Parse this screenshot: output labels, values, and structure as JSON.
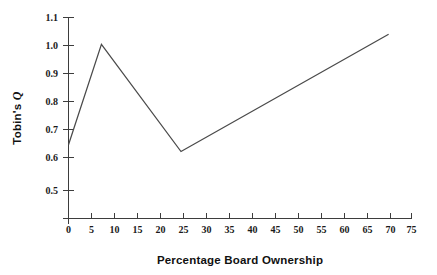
{
  "chart_data": {
    "type": "line",
    "title": "",
    "xlabel": "Percentage Board Ownership",
    "ylabel": "Tobin's Q",
    "ylabel_parts": {
      "prefix": "Tobin's ",
      "symbol": "Q"
    },
    "xlim": [
      0,
      75
    ],
    "ylim": [
      0.5,
      1.1
    ],
    "xticks": [
      0,
      5,
      10,
      15,
      20,
      25,
      30,
      35,
      40,
      45,
      50,
      55,
      60,
      65,
      70,
      75
    ],
    "xtick_labels": [
      "0",
      "5",
      "10",
      "15",
      "20",
      "25",
      "30",
      "35",
      "40",
      "45",
      "50",
      "55",
      "60",
      "65",
      "70",
      "75"
    ],
    "yticks": [
      0.5,
      0.6,
      0.7,
      0.8,
      0.9,
      1.0,
      1.1
    ],
    "ytick_labels": [
      "0.5",
      "0.6",
      "0.7",
      "0.8",
      "0.9",
      "1.0",
      "1.1"
    ],
    "grid": false,
    "legend": null,
    "series": [
      {
        "name": "Tobin's Q vs Percentage Board Ownership",
        "color": "#4a4a4a",
        "x": [
          0,
          7.2,
          24.6,
          70
        ],
        "y": [
          0.72,
          1.02,
          0.7,
          1.05
        ],
        "points": [
          {
            "x": 0,
            "y": 0.72
          },
          {
            "x": 7.2,
            "y": 1.02
          },
          {
            "x": 24.6,
            "y": 0.7
          },
          {
            "x": 70,
            "y": 1.05
          }
        ]
      }
    ],
    "annotations": []
  },
  "figure": {
    "background_color": "#ffffff",
    "axis_color": "#3d3d3d",
    "line_color": "#4a4a4a",
    "text_color": "#1a1a1a"
  }
}
